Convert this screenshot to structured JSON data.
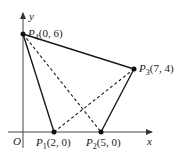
{
  "diagram": {
    "axes": {
      "x_label": "x",
      "y_label": "y",
      "origin_label": "O"
    },
    "points": [
      {
        "id": "P1",
        "name": "P",
        "sub": "1",
        "coords": "(2, 0)",
        "x": 2,
        "y": 0
      },
      {
        "id": "P2",
        "name": "P",
        "sub": "2",
        "coords": "(5, 0)",
        "x": 5,
        "y": 0
      },
      {
        "id": "P3",
        "name": "P",
        "sub": "3",
        "coords": "(7, 4)",
        "x": 7,
        "y": 4
      },
      {
        "id": "P4",
        "name": "P",
        "sub": "4",
        "coords": "(0, 6)",
        "x": 0,
        "y": 6
      }
    ],
    "solid_edges": [
      [
        "P1",
        "P2"
      ],
      [
        "P2",
        "P3"
      ],
      [
        "P3",
        "P4"
      ],
      [
        "P4",
        "P1"
      ]
    ],
    "dashed_edges": [
      [
        "P1",
        "P3"
      ],
      [
        "P2",
        "P4"
      ]
    ],
    "colors": {
      "line": "#1a1a1a",
      "axis": "#555555"
    }
  }
}
